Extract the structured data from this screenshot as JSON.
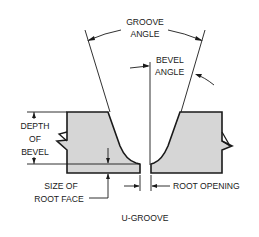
{
  "diagram": {
    "title": "U-GROOVE",
    "labels": {
      "groove_angle_line1": "GROOVE",
      "groove_angle_line2": "ANGLE",
      "bevel_angle_line1": "BEVEL",
      "bevel_angle_line2": "ANGLE",
      "depth_of_bevel_line1": "DEPTH",
      "depth_of_bevel_line2": "OF",
      "depth_of_bevel_line3": "BEVEL",
      "root_face_line1": "SIZE OF",
      "root_face_line2": "ROOT FACE",
      "root_opening": "ROOT OPENING"
    },
    "colors": {
      "plate_fill": "#d6d6d6",
      "line": "#1a1a1a",
      "background": "#ffffff"
    }
  }
}
